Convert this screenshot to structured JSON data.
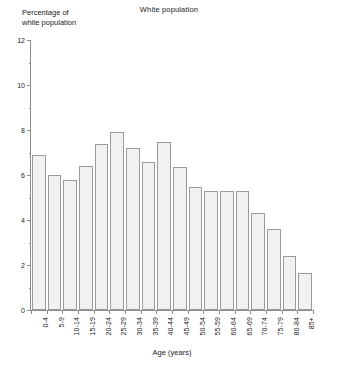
{
  "chart_data": {
    "type": "bar",
    "title": "White population",
    "xlabel": "Age (years)",
    "ylabel": "Percentage of white population",
    "ylabel_lines": [
      "Percentage of",
      "white population"
    ],
    "categories": [
      "0-4",
      "5-9",
      "10-14",
      "15-19",
      "20-24",
      "25-29",
      "30-34",
      "35-39",
      "40-44",
      "45-49",
      "50-54",
      "55-59",
      "60-64",
      "65-69",
      "70-74",
      "75-79",
      "80-84",
      "85+"
    ],
    "values": [
      6.9,
      6.0,
      5.8,
      6.4,
      7.4,
      7.9,
      7.2,
      6.6,
      7.45,
      6.35,
      5.45,
      5.3,
      5.3,
      5.3,
      4.3,
      3.6,
      2.4,
      1.65
    ],
    "ylim": [
      0,
      12
    ],
    "ytick_major": [
      0,
      2,
      4,
      6,
      8,
      10,
      12
    ],
    "ytick_minor": [
      1,
      3,
      5,
      7,
      9,
      11
    ],
    "grid": false,
    "legend": "none",
    "colors": {
      "bar_fill": "#f1f1f1",
      "bar_border": "#9a9a9a",
      "axis": "#8c8c8c",
      "text": "#1a1a1a",
      "background": "#ffffff"
    }
  }
}
